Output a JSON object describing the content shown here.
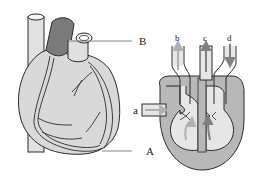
{
  "figure": {
    "type": "heart diagram",
    "left_panel": "external view of heart with coronary vessels",
    "right_panel": "schematic cross-section of heart chambers with blood flow arrows"
  },
  "labels": {
    "B": "B",
    "A": "A",
    "a": "a",
    "b": "b",
    "c": "c",
    "d": "d"
  },
  "colors": {
    "heart_fill": "#d9d9d9",
    "dark_vessel": "#7a7a7a",
    "outline": "#2a2a2a",
    "chamber_wall": "#b8b8b8",
    "chamber_inner": "#e6e6e6",
    "arrow_light": "#b0b0b0",
    "arrow_dark": "#808080"
  }
}
